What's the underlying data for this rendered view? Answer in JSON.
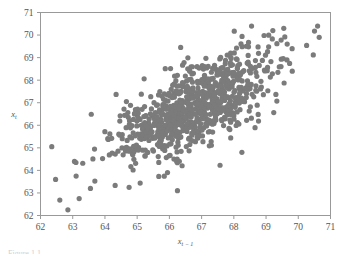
{
  "figure": {
    "kind": "scatter-plot",
    "background_color": "#ffffff",
    "caption_sliver_text": "Figure 1.1"
  },
  "chart_data": {
    "type": "scatter",
    "title": "",
    "subtitle": "",
    "xlabel": "x",
    "xlabel_sub": "t − 1",
    "ylabel": "x",
    "ylabel_sub": "t",
    "xlim": [
      62,
      71
    ],
    "ylim": [
      62,
      71
    ],
    "xticks": [
      62,
      63,
      64,
      65,
      66,
      67,
      68,
      69,
      70,
      71
    ],
    "yticks": [
      62,
      63,
      64,
      65,
      66,
      67,
      68,
      69,
      70,
      71
    ],
    "xtick_labels": [
      "62",
      "63",
      "64",
      "65",
      "66",
      "67",
      "68",
      "69",
      "70",
      "71"
    ],
    "ytick_labels": [
      "62",
      "63",
      "64",
      "65",
      "66",
      "67",
      "68",
      "69",
      "70",
      "71"
    ],
    "grid": false,
    "legend": null,
    "marker": {
      "shape": "circle",
      "color": "#7b7b7b",
      "radius_px": 2.6,
      "opacity": 1
    },
    "point_count": 920,
    "correlation_approx": 0.72,
    "mean_x": 66.8,
    "mean_y": 66.8,
    "sd_x": 1.25,
    "sd_y": 1.25,
    "notable_points": [
      [
        62.35,
        65.05
      ],
      [
        62.85,
        62.25
      ],
      [
        63.2,
        62.75
      ],
      [
        63.1,
        64.35
      ],
      [
        63.55,
        63.2
      ],
      [
        66.25,
        63.1
      ],
      [
        68.25,
        64.8
      ],
      [
        66.35,
        69.45
      ],
      [
        70.6,
        70.4
      ],
      [
        70.65,
        69.9
      ],
      [
        68.55,
        70.4
      ],
      [
        69.55,
        70.3
      ]
    ]
  }
}
